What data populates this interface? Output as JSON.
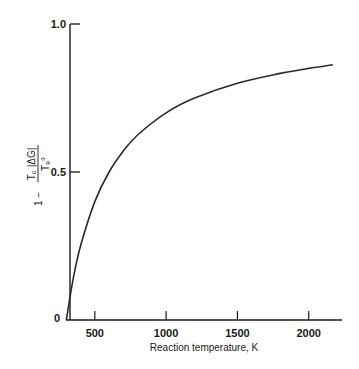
{
  "chart_data": {
    "type": "line",
    "title": "",
    "xlabel": "Reaction temperature, K",
    "ylabel": "1 − T0|ΔG| / Te°",
    "xlim": [
      300,
      2250
    ],
    "ylim": [
      0,
      1.0
    ],
    "x_ticks": [
      500,
      1000,
      1500,
      2000
    ],
    "x_tick_labels": [
      "500",
      "1000",
      "1500",
      "2000"
    ],
    "y_ticks": [
      0,
      0.5,
      1.0
    ],
    "y_tick_labels": [
      "0",
      "0.5",
      "1.0"
    ],
    "grid": false,
    "legend": null,
    "series": [
      {
        "name": "efficiency",
        "color": "#2a2a2a",
        "x": [
          300,
          350,
          400,
          500,
          600,
          700,
          800,
          1000,
          1200,
          1500,
          1800,
          2000,
          2170
        ],
        "y": [
          0.0,
          0.143,
          0.25,
          0.4,
          0.5,
          0.571,
          0.625,
          0.7,
          0.75,
          0.8,
          0.833,
          0.85,
          0.862
        ]
      }
    ]
  },
  "labels": {
    "y_label_prefix": "1 −",
    "y_label_numerator": "T₀ |ΔG|",
    "y_label_denominator": "Tₑ°",
    "x_label": "Reaction temperature, K",
    "origin": "0"
  }
}
